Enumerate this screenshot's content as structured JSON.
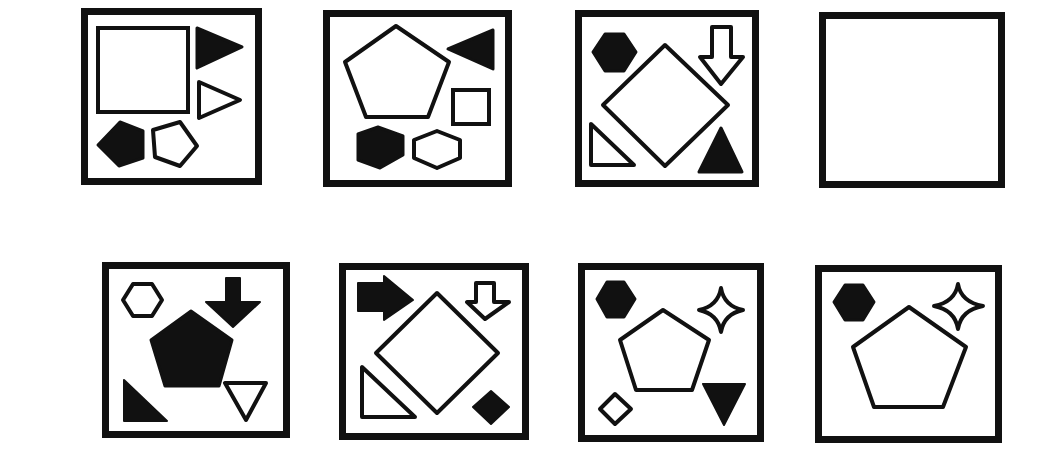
{
  "puzzle": {
    "type": "visual analogy",
    "connectors": {
      "is_to_1": [
        "is",
        "to"
      ],
      "as": "as",
      "is_to_2": [
        "is",
        "to"
      ]
    },
    "unknown_symbol": "?",
    "panels": [
      {
        "id": "panel-1",
        "shapes": [
          "large-outline-square",
          "filled-triangle-right",
          "outline-triangle-right",
          "filled-pentagon",
          "outline-pentagon"
        ]
      },
      {
        "id": "panel-2",
        "shapes": [
          "large-outline-pentagon",
          "filled-triangle-left",
          "outline-square",
          "filled-pentagon",
          "outline-hexagon"
        ]
      },
      {
        "id": "panel-3",
        "shapes": [
          "large-outline-diamond",
          "filled-hexagon",
          "outline-down-arrow",
          "outline-right-triangle",
          "filled-triangle-up"
        ]
      },
      {
        "id": "panel-4",
        "shapes": [
          "question-mark"
        ]
      }
    ]
  },
  "options": [
    {
      "label": "A)",
      "shapes": [
        "filled-pentagon",
        "outline-hexagon",
        "filled-down-arrow",
        "filled-right-triangle",
        "outline-triangle-down"
      ]
    },
    {
      "label": "B)",
      "shapes": [
        "large-outline-diamond",
        "filled-right-arrow",
        "outline-down-arrow",
        "outline-right-triangle",
        "filled-diamond"
      ]
    },
    {
      "label": "C)",
      "shapes": [
        "large-outline-pentagon",
        "filled-hexagon",
        "outline-four-point-star",
        "outline-diamond",
        "filled-triangle-down"
      ]
    },
    {
      "label": "D)",
      "shapes": [
        "large-outline-pentagon",
        "filled-hexagon",
        "outline-four-point-star",
        "outline-diamond",
        "filled-triangle-up"
      ]
    }
  ],
  "colors": {
    "ink": "#111111",
    "background": "#ffffff"
  }
}
